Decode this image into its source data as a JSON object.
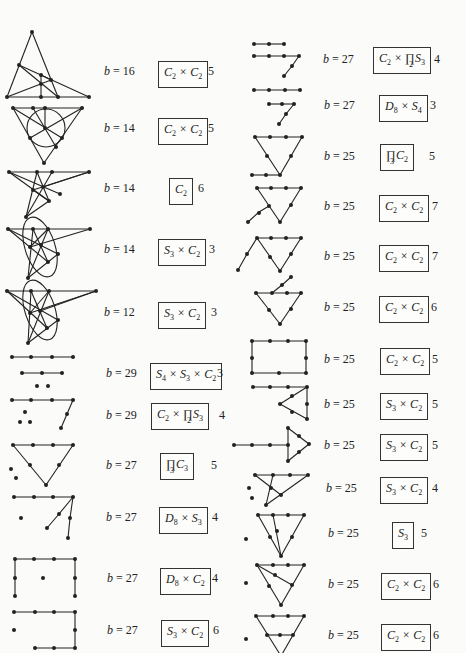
{
  "left_column": [
    {
      "b": "16",
      "group": "C_2 × C_2",
      "count": "5"
    },
    {
      "b": "14",
      "group": "C_2 × C_2",
      "count": "5"
    },
    {
      "b": "14",
      "group": "C_2",
      "count": "6"
    },
    {
      "b": "14",
      "group": "S_3 × C_2",
      "count": "3"
    },
    {
      "b": "12",
      "group": "S_3 × C_2",
      "count": "3"
    },
    {
      "b": "29",
      "group": "S_4 × S_3 × C_2",
      "count": "3"
    },
    {
      "b": "29",
      "group": "C_2 × ∏_2 S_3",
      "count": "4"
    },
    {
      "b": "27",
      "group": "∏_3 C_3",
      "count": "5"
    },
    {
      "b": "27",
      "group": "D_8 × S_3",
      "count": "4"
    },
    {
      "b": "27",
      "group": "D_8 × C_2",
      "count": "4"
    },
    {
      "b": "27",
      "group": "S_3 × C_2",
      "count": "6"
    }
  ],
  "right_column": [
    {
      "b": "27",
      "group": "C_2 × ∏_2 S_3",
      "count": "4"
    },
    {
      "b": "27",
      "group": "D_8 × S_4",
      "count": "3"
    },
    {
      "b": "25",
      "group": "∏_3 C_2",
      "count": "5"
    },
    {
      "b": "25",
      "group": "C_2 × C_2",
      "count": "7"
    },
    {
      "b": "25",
      "group": "C_2 × C_2",
      "count": "7"
    },
    {
      "b": "25",
      "group": "C_2 × C_2",
      "count": "6"
    },
    {
      "b": "25",
      "group": "C_2 × C_2",
      "count": "5"
    },
    {
      "b": "25",
      "group": "S_3 × C_2",
      "count": "5"
    },
    {
      "b": "25",
      "group": "S_3 × C_2",
      "count": "5"
    },
    {
      "b": "25",
      "group": "S_3 × C_2",
      "count": "4"
    },
    {
      "b": "25",
      "group": "S_3",
      "count": "5"
    },
    {
      "b": "25",
      "group": "C_2 × C_2",
      "count": "6"
    },
    {
      "b": "25",
      "group": "C_2 × C_2",
      "count": "6"
    }
  ],
  "labels": {
    "b_prefix": "b = "
  }
}
